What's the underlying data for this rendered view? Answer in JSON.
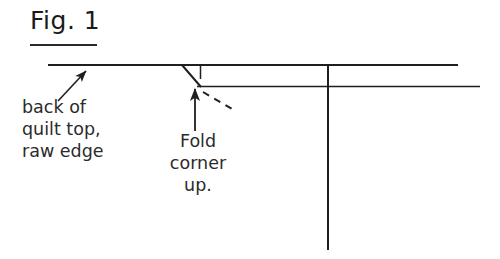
{
  "figure": {
    "title": "Fig. 1",
    "background_color": "#ffffff",
    "ink_color": "#1f1f1f",
    "text_color": "#2b2b2b",
    "width": 500,
    "height": 259
  },
  "annotations": {
    "left": {
      "name": "back-of-quilt-top-label",
      "line1": "back of",
      "line2": "quilt top,",
      "line3": "raw edge"
    },
    "center": {
      "name": "fold-corner-up-label",
      "line1": "Fold",
      "line2": "corner",
      "line3": "up."
    }
  },
  "geometry": {
    "title_underline": {
      "x1": 30,
      "y1": 45,
      "x2": 97,
      "y2": 45,
      "width": 2.2
    },
    "top_edge_line": {
      "x1": 48,
      "y1": 65,
      "x2": 458,
      "y2": 65,
      "width": 2.0
    },
    "fold_diagonal": {
      "x1": 182,
      "y1": 65,
      "x2": 201,
      "y2": 87,
      "width": 2.0
    },
    "fold_tick": {
      "x1": 200.5,
      "y1": 65,
      "x2": 200.5,
      "y2": 79,
      "width": 1.5
    },
    "lower_edge_line": {
      "x1": 197,
      "y1": 86.5,
      "x2": 480,
      "y2": 86.5,
      "width": 1.5
    },
    "vertical_seam_line": {
      "x1": 328,
      "y1": 64,
      "x2": 328,
      "y2": 250,
      "width": 2.0
    },
    "dashed_fold_hint": {
      "x1": 203,
      "y1": 92,
      "x2": 234,
      "y2": 110,
      "width": 2.0,
      "dash": "7 6"
    },
    "left_arrow": {
      "x1": 58,
      "y1": 101,
      "x2": 86,
      "y2": 71,
      "width": 1.6
    },
    "center_arrow": {
      "x1": 195,
      "y1": 131,
      "x2": 195,
      "y2": 89,
      "width": 1.8
    }
  }
}
